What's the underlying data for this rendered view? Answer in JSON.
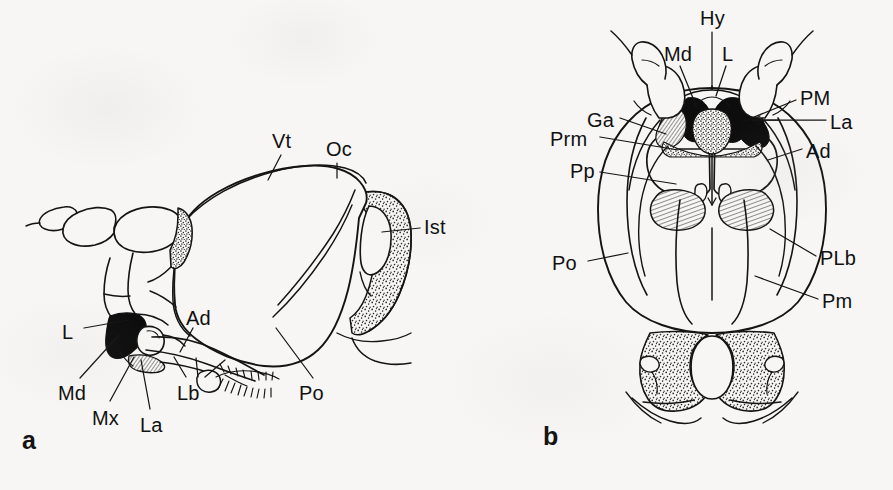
{
  "figure": {
    "kind": "scientific-line-drawing",
    "background_color": "#f7f6f4",
    "ink_color": "#111111",
    "panel_count": 2
  },
  "panels": [
    {
      "letter": "a",
      "name": "lateral-view",
      "letter_x": 22,
      "letter_y": 428,
      "labels": [
        {
          "text": "Vt",
          "x": 272,
          "y": 131,
          "name": "label-vt"
        },
        {
          "text": "Oc",
          "x": 326,
          "y": 139,
          "name": "label-oc"
        },
        {
          "text": "Ist",
          "x": 424,
          "y": 217,
          "name": "label-ist"
        },
        {
          "text": "L",
          "x": 62,
          "y": 322,
          "name": "label-l"
        },
        {
          "text": "Ad",
          "x": 186,
          "y": 308,
          "name": "label-ad"
        },
        {
          "text": "Md",
          "x": 58,
          "y": 383,
          "name": "label-md"
        },
        {
          "text": "Mx",
          "x": 92,
          "y": 408,
          "name": "label-mx"
        },
        {
          "text": "La",
          "x": 140,
          "y": 415,
          "name": "label-la"
        },
        {
          "text": "Lb",
          "x": 177,
          "y": 383,
          "name": "label-lb"
        },
        {
          "text": "Po",
          "x": 299,
          "y": 383,
          "name": "label-po"
        }
      ]
    },
    {
      "letter": "b",
      "name": "ventral-view",
      "letter_x": 543,
      "letter_y": 424,
      "labels": [
        {
          "text": "Hy",
          "x": 700,
          "y": 8,
          "name": "label-hy"
        },
        {
          "text": "Md",
          "x": 664,
          "y": 44,
          "name": "label-md"
        },
        {
          "text": "L",
          "x": 722,
          "y": 44,
          "name": "label-l"
        },
        {
          "text": "PM",
          "x": 800,
          "y": 88,
          "name": "label-pm"
        },
        {
          "text": "La",
          "x": 830,
          "y": 112,
          "name": "label-la"
        },
        {
          "text": "Ga",
          "x": 587,
          "y": 110,
          "name": "label-ga"
        },
        {
          "text": "Prm",
          "x": 550,
          "y": 129,
          "name": "label-prm"
        },
        {
          "text": "Ad",
          "x": 806,
          "y": 141,
          "name": "label-ad"
        },
        {
          "text": "Pp",
          "x": 570,
          "y": 161,
          "name": "label-pp"
        },
        {
          "text": "Po",
          "x": 552,
          "y": 253,
          "name": "label-po"
        },
        {
          "text": "PLb",
          "x": 820,
          "y": 248,
          "name": "label-plb"
        },
        {
          "text": "Pm",
          "x": 822,
          "y": 291,
          "name": "label-pm-mentum"
        }
      ]
    }
  ],
  "abbreviations": [
    "Vt",
    "Oc",
    "Ist",
    "L",
    "Ad",
    "Md",
    "Mx",
    "La",
    "Lb",
    "Po",
    "Hy",
    "PM",
    "Ga",
    "Prm",
    "Pp",
    "PLb",
    "Pm"
  ]
}
